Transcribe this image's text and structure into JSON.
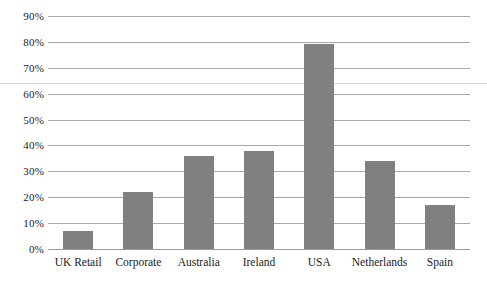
{
  "chart_data": {
    "type": "bar",
    "title": "",
    "subtitle": "",
    "xlabel": "",
    "ylabel": "",
    "categories": [
      "UK Retail",
      "Corporate",
      "Australia",
      "Ireland",
      "USA",
      "Netherlands",
      "Spain"
    ],
    "values": [
      7,
      22,
      36,
      38,
      79,
      34,
      17
    ],
    "value_suffix": "%",
    "ylim": [
      0,
      90
    ],
    "y_ticks": [
      0,
      10,
      20,
      30,
      40,
      50,
      60,
      70,
      80,
      90
    ],
    "y_tick_labels": [
      "0%",
      "10%",
      "20%",
      "30%",
      "40%",
      "50%",
      "60%",
      "70%",
      "80%",
      "90%"
    ],
    "grid": true,
    "grid_axis": "y",
    "legend": false,
    "legend_position": "none",
    "series": [
      {
        "name": "",
        "values": [
          7,
          22,
          36,
          38,
          79,
          34,
          17
        ]
      }
    ]
  },
  "style": {
    "bar_color": "#808080",
    "gridline_color": "#a8a8a8",
    "axis_color": "#9a9a9a",
    "background_color": "#ffffff",
    "text_color": "#1a1a1a",
    "page_divider_color": "#d6d6d6"
  }
}
